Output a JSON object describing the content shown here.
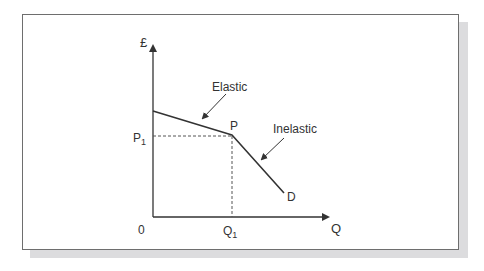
{
  "diagram": {
    "y_axis_label": "£",
    "x_axis_label": "Q",
    "origin_label": "0",
    "price_label": "P",
    "price_subscript": "1",
    "quantity_label": "Q",
    "quantity_subscript": "1",
    "kink_point_label": "P",
    "curve_label": "D",
    "annotations": {
      "upper": "Elastic",
      "lower": "Inelastic"
    },
    "colors": {
      "line": "#333333",
      "frame": "#6e6e6e",
      "shadow": "#dcdcde",
      "dashed": "#555555"
    }
  }
}
